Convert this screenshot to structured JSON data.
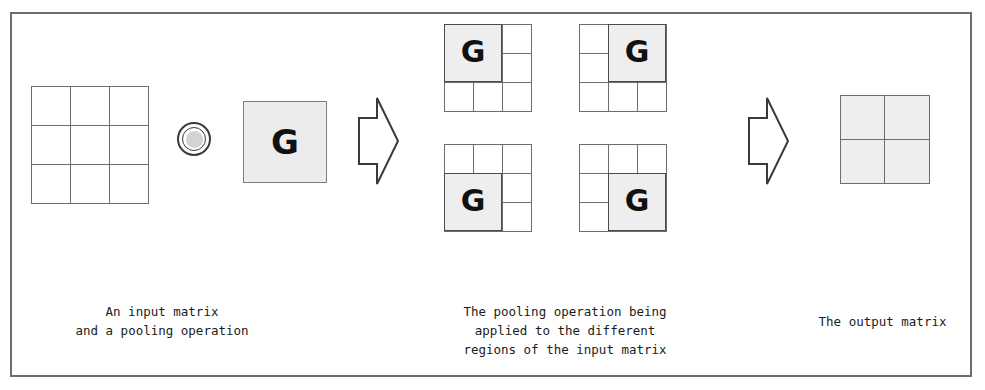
{
  "figure": {
    "border_color": "#6e6e6e",
    "background": "#ffffff",
    "shade_color": "#eeeeee",
    "line_color": "#6d6d6d",
    "text_color": "#1c1c1c"
  },
  "input": {
    "label": "input-matrix",
    "rows": 3,
    "cols": 3,
    "cells": [
      [
        "",
        "",
        ""
      ],
      [
        "",
        "",
        ""
      ],
      [
        "",
        "",
        ""
      ]
    ]
  },
  "operator": {
    "symbol_name": "circled-operator-icon",
    "symbol": "◎"
  },
  "pooling_op": {
    "glyph": "G",
    "label": "pooling operation G"
  },
  "arrows": [
    {
      "name": "arrow-apply",
      "direction": "right",
      "glyph": "⇒"
    },
    {
      "name": "arrow-result",
      "direction": "right",
      "glyph": "⇒"
    }
  ],
  "regions": [
    {
      "name": "grid-top-left",
      "position": "top-left",
      "glyph": "G",
      "shaded_cells": [
        [
          0,
          0
        ],
        [
          0,
          1
        ],
        [
          1,
          0
        ],
        [
          1,
          1
        ]
      ]
    },
    {
      "name": "grid-top-right",
      "position": "top-right",
      "glyph": "G",
      "shaded_cells": [
        [
          0,
          1
        ],
        [
          0,
          2
        ],
        [
          1,
          1
        ],
        [
          1,
          2
        ]
      ]
    },
    {
      "name": "grid-bottom-left",
      "position": "bottom-left",
      "glyph": "G",
      "shaded_cells": [
        [
          1,
          0
        ],
        [
          1,
          1
        ],
        [
          2,
          0
        ],
        [
          2,
          1
        ]
      ]
    },
    {
      "name": "grid-bottom-right",
      "position": "bottom-right",
      "glyph": "G",
      "shaded_cells": [
        [
          1,
          1
        ],
        [
          1,
          2
        ],
        [
          2,
          1
        ],
        [
          2,
          2
        ]
      ]
    }
  ],
  "output": {
    "label": "output-matrix",
    "rows": 2,
    "cols": 2,
    "all_shaded": true,
    "cells": [
      [
        "",
        ""
      ],
      [
        "",
        ""
      ]
    ]
  },
  "captions": {
    "left": "An input matrix\nand a pooling operation",
    "middle": "The pooling operation being\napplied to the different\nregions of the input matrix",
    "right": "The output matrix"
  }
}
